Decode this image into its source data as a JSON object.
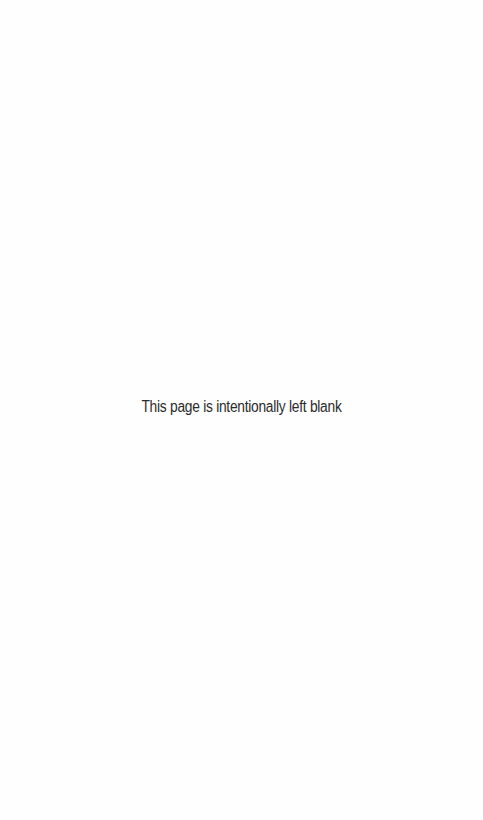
{
  "page": {
    "message": "This page is intentionally left blank"
  }
}
